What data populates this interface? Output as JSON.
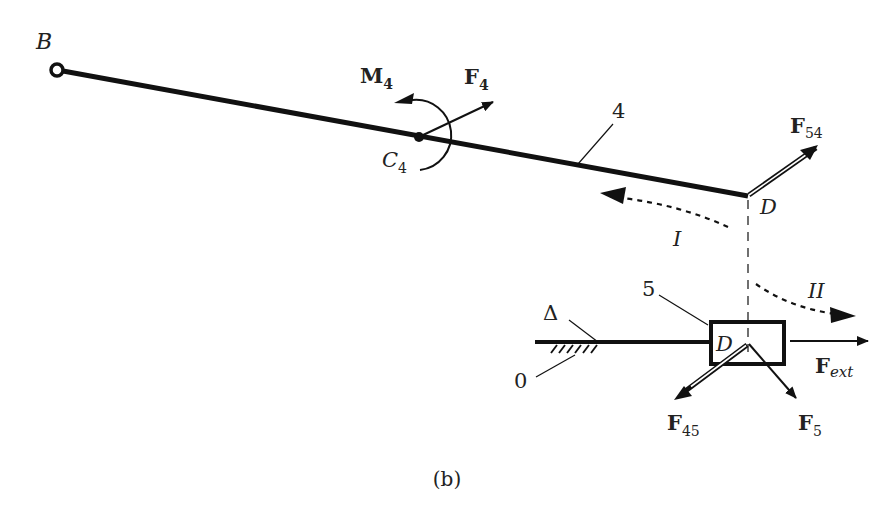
{
  "figure": {
    "caption": "(b)",
    "points": {
      "B": "B",
      "C4": {
        "base": "C",
        "sub": "4"
      },
      "D_top": "D",
      "D_slider": "D"
    },
    "bodies": {
      "link": "4",
      "slider": "5",
      "ground": "0",
      "guide": "Δ"
    },
    "forces": {
      "M4": {
        "base": "M",
        "sub": "4"
      },
      "F4": {
        "base": "F",
        "sub": "4"
      },
      "F54": {
        "base": "F",
        "sub": "54"
      },
      "F45": {
        "base": "F",
        "sub": "45"
      },
      "F5": {
        "base": "F",
        "sub": "5"
      },
      "Fext": {
        "base": "F",
        "sub": "ext"
      }
    },
    "motion_paths": {
      "I": "I",
      "II": "II"
    },
    "colors": {
      "ink": "#111111",
      "background": "#ffffff"
    }
  }
}
